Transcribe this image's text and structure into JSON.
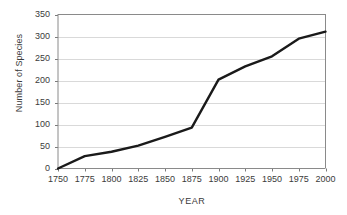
{
  "chart_data": {
    "type": "line",
    "title": "",
    "xlabel": "YEAR",
    "ylabel": "Number of Species",
    "x": [
      1750,
      1775,
      1800,
      1825,
      1850,
      1875,
      1900,
      1925,
      1950,
      1975,
      2000
    ],
    "values": [
      0,
      28,
      38,
      52,
      72,
      93,
      202,
      232,
      255,
      295,
      311
    ],
    "series": [
      {
        "name": "Number of Species",
        "values": [
          0,
          28,
          38,
          52,
          72,
          93,
          202,
          232,
          255,
          295,
          311
        ],
        "color": "#1a1a1a"
      }
    ],
    "xlim": [
      1750,
      2000
    ],
    "ylim": [
      0,
      350
    ],
    "x_ticks": [
      "1750",
      "1775",
      "1800",
      "1825",
      "1850",
      "1875",
      "1900",
      "1925",
      "1950",
      "1975",
      "2000"
    ],
    "y_ticks": [
      "0",
      "50",
      "100",
      "150",
      "200",
      "250",
      "300",
      "350"
    ],
    "grid": "horizontal",
    "legend": "none",
    "grid_color": "#d9d9d9",
    "axis_color": "#7a7a7a",
    "background": "#ffffff"
  }
}
